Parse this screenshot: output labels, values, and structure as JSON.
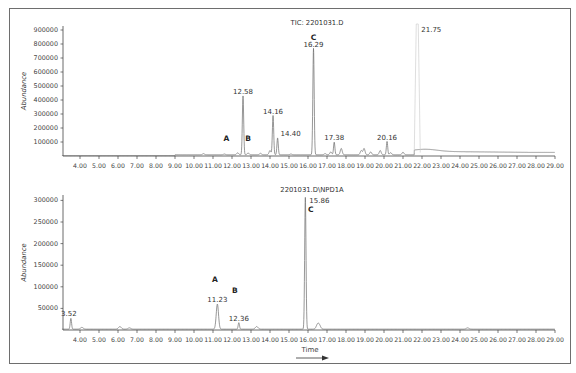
{
  "chart_data": [
    {
      "type": "line",
      "title": "TIC: 2201031.D",
      "xlabel": "",
      "ylabel": "Abundance",
      "xlim": [
        3.0,
        29.0
      ],
      "ylim": [
        0,
        950000
      ],
      "grid": false,
      "x_ticks": [
        "4.00",
        "5.00",
        "6.00",
        "7.00",
        "8.00",
        "9.00",
        "10.00",
        "11.00",
        "12.00",
        "13.00",
        "14.00",
        "15.00",
        "16.00",
        "17.00",
        "18.00",
        "19.00",
        "20.00",
        "21.00",
        "22.00",
        "23.00",
        "24.00",
        "25.00",
        "26.00",
        "27.00",
        "28.00",
        "29.00"
      ],
      "y_ticks": [
        "100000",
        "200000",
        "300000",
        "400000",
        "500000",
        "600000",
        "700000",
        "800000",
        "900000"
      ],
      "peaks": [
        {
          "rt": 12.58,
          "abundance": 420000,
          "label": "12.58"
        },
        {
          "rt": 14.16,
          "abundance": 280000,
          "label": "14.16"
        },
        {
          "rt": 14.4,
          "abundance": 120000,
          "label": "14.40"
        },
        {
          "rt": 16.29,
          "abundance": 760000,
          "label": "16.29"
        },
        {
          "rt": 17.38,
          "abundance": 90000,
          "label": "17.38"
        },
        {
          "rt": 20.16,
          "abundance": 95000,
          "label": "20.16"
        },
        {
          "rt": 21.75,
          "abundance": 950000,
          "label": "21.75"
        }
      ],
      "annotations": [
        {
          "text": "A",
          "rt": 11.7,
          "abundance": 110000
        },
        {
          "text": "B",
          "rt": 12.85,
          "abundance": 110000
        },
        {
          "text": "C",
          "rt": 16.29,
          "abundance": 860000
        }
      ]
    },
    {
      "type": "line",
      "title": "2201031.D\\NPD1A",
      "xlabel": "Time",
      "ylabel": "Abundance",
      "xlim": [
        3.0,
        29.0
      ],
      "ylim": [
        0,
        310000
      ],
      "grid": false,
      "x_ticks": [
        "4.00",
        "5.00",
        "6.00",
        "7.00",
        "8.00",
        "9.00",
        "10.00",
        "11.00",
        "12.00",
        "13.00",
        "14.00",
        "15.00",
        "16.00",
        "17.00",
        "18.00",
        "19.00",
        "20.00",
        "21.00",
        "22.00",
        "23.00",
        "24.00",
        "25.00",
        "26.00",
        "27.00",
        "28.00",
        "29.00"
      ],
      "y_ticks": [
        "50000",
        "100000",
        "150000",
        "200000",
        "250000",
        "300000"
      ],
      "peaks": [
        {
          "rt": 3.52,
          "abundance": 25000,
          "label": "3.52"
        },
        {
          "rt": 11.23,
          "abundance": 58000,
          "label": "11.23"
        },
        {
          "rt": 12.36,
          "abundance": 15000,
          "label": "12.36"
        },
        {
          "rt": 15.86,
          "abundance": 305000,
          "label": "15.86"
        }
      ],
      "annotations": [
        {
          "text": "A",
          "rt": 11.1,
          "abundance": 110000
        },
        {
          "text": "B",
          "rt": 12.15,
          "abundance": 85000
        },
        {
          "text": "C",
          "rt": 16.2,
          "abundance": 280000
        }
      ]
    }
  ],
  "top_chart": {
    "title": "TIC: 2201031.D",
    "ylabel": "Abundance",
    "peak_labels": [
      "12.58",
      "14.16",
      "14.40",
      "16.29",
      "17.38",
      "20.16",
      "21.75"
    ],
    "letters": [
      "A",
      "B",
      "C"
    ]
  },
  "bottom_chart": {
    "title": "2201031.D\\NPD1A",
    "ylabel": "Abundance",
    "xlabel": "Time",
    "peak_labels": [
      "3.52",
      "11.23",
      "12.36",
      "15.86"
    ],
    "letters": [
      "A",
      "B",
      "C"
    ]
  },
  "colors": {
    "trace": "#6a6a6a",
    "saturated_trace": "#d0d0d0",
    "axis": "#444444",
    "frame": "#6e6e6e"
  }
}
